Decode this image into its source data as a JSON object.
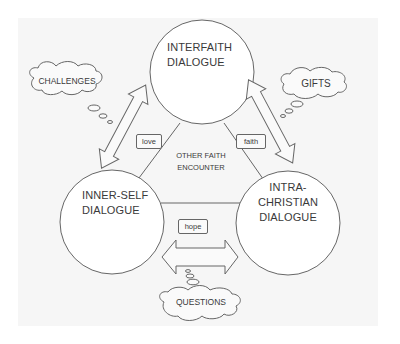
{
  "diagram": {
    "circles": {
      "top": {
        "line1": "INTERFAITH",
        "line2": "DIALOGUE"
      },
      "left": {
        "line1": "INNER-SELF",
        "line2": "DIALOGUE"
      },
      "right": {
        "line1": "INTRA-",
        "line2": "CHRISTIAN",
        "line3": "DIALOGUE"
      }
    },
    "center": {
      "line1": "OTHER FAITH",
      "line2": "ENCOUNTER"
    },
    "boxes": {
      "left": "love",
      "right": "faith",
      "bottom": "hope"
    },
    "clouds": {
      "left": "CHALLENGES",
      "right": "GIFTS",
      "bottom": "QUESTIONS"
    },
    "colors": {
      "stroke": "#666666",
      "text": "#3a3a3a",
      "background": "#f6f6f6",
      "fill": "#ffffff"
    }
  }
}
